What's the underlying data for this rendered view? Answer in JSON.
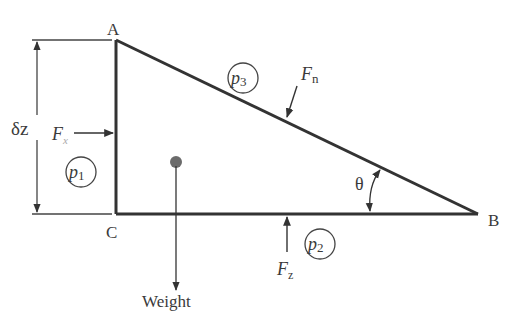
{
  "diagram": {
    "vertices": {
      "A": {
        "label": "A"
      },
      "B": {
        "label": "B"
      },
      "C": {
        "label": "C"
      }
    },
    "dimension": {
      "label": "δz"
    },
    "forces": {
      "horizontal": {
        "symbol": "F",
        "subscript": "x"
      },
      "normal": {
        "symbol": "F",
        "subscript": "n"
      },
      "vertical": {
        "symbol": "F",
        "subscript": "z"
      },
      "weight": {
        "label": "Weight"
      }
    },
    "pressures": {
      "p1": {
        "symbol": "p",
        "subscript": "1"
      },
      "p2": {
        "symbol": "p",
        "subscript": "2"
      },
      "p3": {
        "symbol": "p",
        "subscript": "3"
      }
    },
    "angle": {
      "label": "θ"
    },
    "colors": {
      "line": "#333333",
      "text": "#3a3a3a",
      "centroid": "#6b6b6b",
      "background": "#ffffff"
    }
  }
}
